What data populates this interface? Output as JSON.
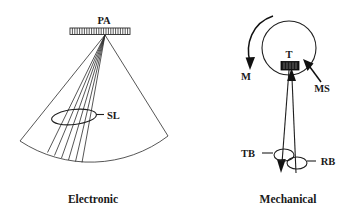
{
  "figure": {
    "background_color": "#ffffff",
    "line_color": "#2b2b2b",
    "text_color": "#1a1a1a",
    "width": 344,
    "height": 218
  },
  "panels": [
    {
      "id": "electronic",
      "caption": "Electronic",
      "labels": [
        {
          "key": "pa",
          "text": "PA",
          "meaning": "phased-array-transducer"
        },
        {
          "key": "sl",
          "text": "SL",
          "meaning": "scan-lines"
        }
      ],
      "elements": {
        "array_name": "phased-array-bar",
        "array_element_count": 24,
        "sector_name": "sector-scan-field",
        "scan_line_count": 6,
        "ellipse_name": "scan-line-callout-ellipse"
      }
    },
    {
      "id": "mechanical",
      "caption": "Mechanical",
      "labels": [
        {
          "key": "t",
          "text": "T",
          "meaning": "transducer"
        },
        {
          "key": "m",
          "text": "M",
          "meaning": "motion-direction"
        },
        {
          "key": "ms",
          "text": "MS",
          "meaning": "mechanical-sweep-path"
        },
        {
          "key": "tb",
          "text": "TB",
          "meaning": "transmit-beam"
        },
        {
          "key": "rb",
          "text": "RB",
          "meaning": "receive-beam"
        }
      ],
      "elements": {
        "circle_name": "mechanical-sweep-circle",
        "transducer_name": "transducer-block",
        "motion_arrow_name": "motion-arc-arrow",
        "ms_pointer_name": "ms-pointer-arrow",
        "beam_down_name": "transmit-beam-line",
        "beam_up_name": "receive-beam-line",
        "tb_ellipse_name": "tb-callout-ellipse",
        "rb_ellipse_name": "rb-callout-ellipse"
      }
    }
  ]
}
